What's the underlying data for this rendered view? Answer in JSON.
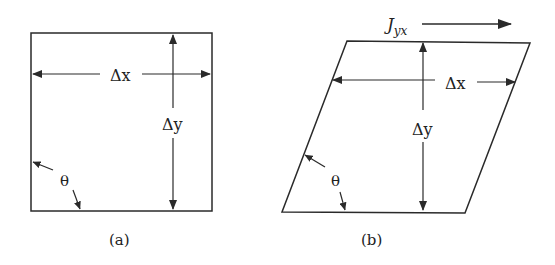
{
  "figure": {
    "panel_a": {
      "caption": "(a)",
      "shape": "square",
      "labels": {
        "dx": "Δx",
        "dy": "Δy",
        "theta": "θ"
      }
    },
    "panel_b": {
      "caption": "(b)",
      "shape": "parallelogram (sheared)",
      "labels": {
        "dx": "Δx",
        "dy": "Δy",
        "theta": "θ",
        "flux_main": "J",
        "flux_sub": "yx"
      }
    },
    "colors": {
      "stroke": "#2a2a2a",
      "background": "#ffffff"
    }
  }
}
